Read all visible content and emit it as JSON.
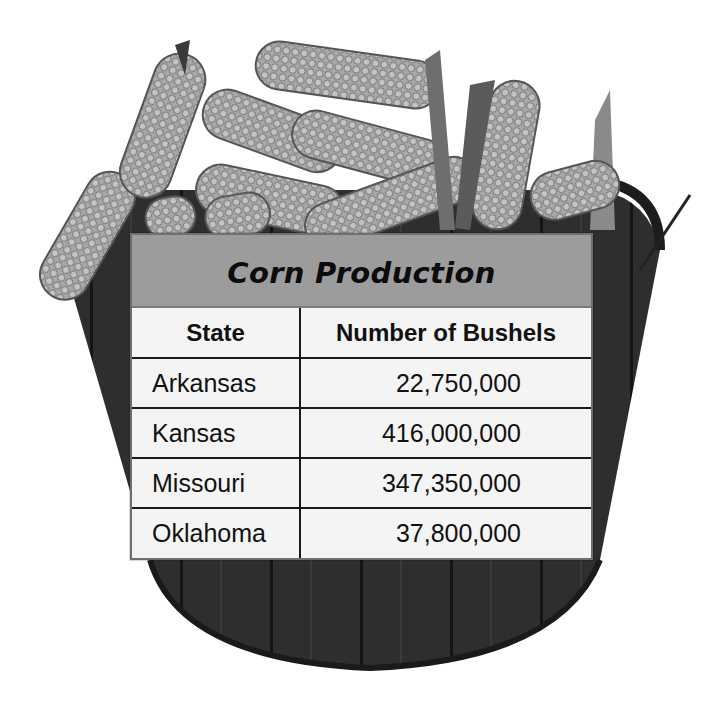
{
  "table": {
    "title": "Corn Production",
    "headers": [
      "State",
      "Number of Bushels"
    ],
    "rows": [
      {
        "state": "Arkansas",
        "bushels": "22,750,000"
      },
      {
        "state": "Kansas",
        "bushels": "416,000,000"
      },
      {
        "state": "Missouri",
        "bushels": "347,350,000"
      },
      {
        "state": "Oklahoma",
        "bushels": "37,800,000"
      }
    ]
  },
  "illustration": {
    "subject": "basket-of-corn",
    "colors": {
      "basket": "#2b2b2b",
      "corn": "#a8a8a8",
      "corn_dark": "#6d6d6d",
      "title_band": "#9c9c9c",
      "table_bg": "#f4f4f4"
    }
  }
}
